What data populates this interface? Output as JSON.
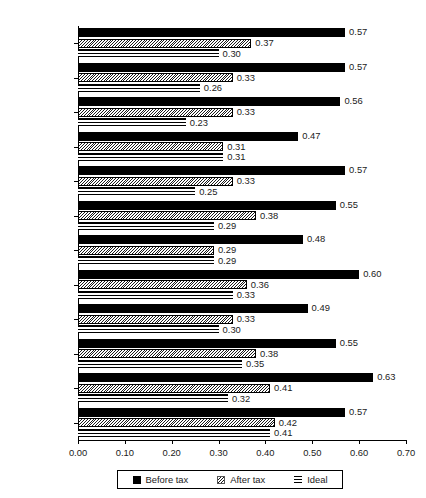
{
  "chart_data": {
    "type": "bar",
    "orientation": "horizontal",
    "title": "",
    "xlabel": "",
    "ylabel": "",
    "xlim": [
      0.0,
      0.7
    ],
    "xticks": [
      "0.00",
      "0.10",
      "0.20",
      "0.30",
      "0.40",
      "0.50",
      "0.60",
      "0.70"
    ],
    "xtick_values": [
      0.0,
      0.1,
      0.2,
      0.3,
      0.4,
      0.5,
      0.6,
      0.7
    ],
    "grid": false,
    "legend_position": "bottom",
    "categories": [
      "Norway",
      "Sweden",
      "Denmark",
      "Switzerland",
      "Netherlands",
      "Australia",
      "France",
      "Germany",
      "Japan",
      "Canada",
      "UK",
      "US"
    ],
    "series": [
      {
        "name": "Before tax",
        "pattern": "solid-black",
        "values": [
          0.57,
          0.57,
          0.56,
          0.47,
          0.57,
          0.55,
          0.48,
          0.6,
          0.49,
          0.55,
          0.63,
          0.57
        ],
        "labels": [
          "0.57",
          "0.57",
          "0.56",
          "0.47",
          "0.57",
          "0.55",
          "0.48",
          "0.60",
          "0.49",
          "0.55",
          "0.63",
          "0.57"
        ]
      },
      {
        "name": "After tax",
        "pattern": "diagonal-hatch",
        "values": [
          0.37,
          0.33,
          0.33,
          0.31,
          0.33,
          0.38,
          0.29,
          0.36,
          0.33,
          0.38,
          0.41,
          0.42
        ],
        "labels": [
          "0.37",
          "0.33",
          "0.33",
          "0.31",
          "0.33",
          "0.38",
          "0.29",
          "0.36",
          "0.33",
          "0.38",
          "0.41",
          "0.42"
        ]
      },
      {
        "name": "Ideal",
        "pattern": "horizontal-lines",
        "values": [
          0.3,
          0.26,
          0.23,
          0.31,
          0.25,
          0.29,
          0.29,
          0.33,
          0.3,
          0.35,
          0.32,
          0.41
        ],
        "labels": [
          "0.30",
          "0.26",
          "0.23",
          "0.31",
          "0.25",
          "0.29",
          "0.29",
          "0.33",
          "0.30",
          "0.35",
          "0.32",
          "0.41"
        ]
      }
    ]
  },
  "legend": {
    "items": [
      {
        "label": "Before tax"
      },
      {
        "label": "After tax"
      },
      {
        "label": "Ideal"
      }
    ]
  },
  "colors": {
    "bar_before": "#000000",
    "bar_after": "#1a1a1a",
    "bar_ideal": "#000000",
    "axis": "#000000",
    "text": "#1a1a1a",
    "background": "#ffffff"
  }
}
